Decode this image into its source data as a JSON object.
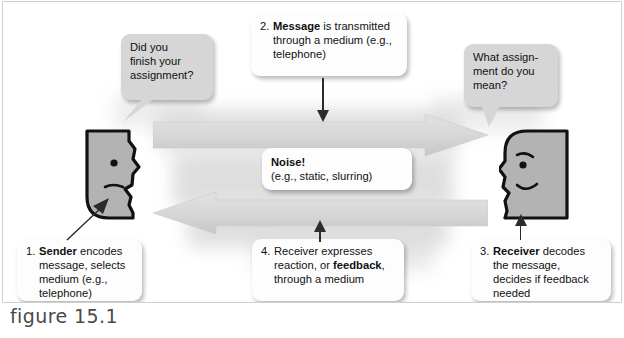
{
  "figure": {
    "caption": "figure 15.1"
  },
  "bubbles": {
    "sender_question": "Did you finish your assignment?",
    "sender_question_lines": [
      "Did you",
      "finish your",
      "assignment?"
    ],
    "receiver_question": "What assignment do you mean?",
    "receiver_question_lines": [
      "What assign-",
      "ment do you",
      "mean?"
    ]
  },
  "steps": [
    {
      "number": "1.",
      "bold": "Sender",
      "rest": " encodes message, selects medium (e.g., telephone)",
      "lines": [
        "message, selects",
        "medium (e.g.,",
        "telephone)"
      ]
    },
    {
      "number": "2.",
      "bold": "Message",
      "rest": " is transmitted through a medium (e.g., telephone)",
      "lines": [
        "through a medium (e.g.,",
        "telephone)"
      ]
    },
    {
      "number": "3.",
      "bold": "Receiver",
      "rest": " decodes the message, decides if feedback needed",
      "lines": [
        "the message,",
        "decides if feedback",
        "needed"
      ]
    },
    {
      "number": "4.",
      "prefix": "Receiver expresses",
      "middle_pre": "reaction, or ",
      "bold": "feedback",
      "middle_post": ",",
      "lines": [
        "through a medium"
      ]
    }
  ],
  "noise": {
    "title": "Noise!",
    "detail": "(e.g., static, slurring)"
  },
  "actors": {
    "sender_label": "sender-head",
    "receiver_label": "receiver-head"
  },
  "arrows": {
    "message_flow": "message arrow pointing right",
    "feedback_flow": "feedback arrow pointing left"
  },
  "colors": {
    "arrow_fill": "#d8d8d8",
    "head_fill": "#b3b3b3",
    "bubble_fill": "#d6d6d6",
    "box_fill": "#fdfdfd",
    "outline": "#111111",
    "caption": "#4a4a4a"
  }
}
